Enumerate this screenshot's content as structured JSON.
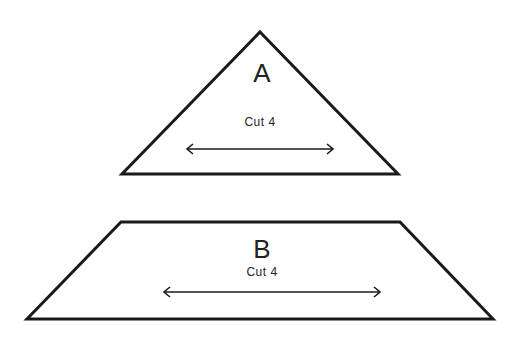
{
  "pieces": [
    {
      "id": "A",
      "shape": "triangle",
      "label": "A",
      "instruction": "Cut 4",
      "grain": "horizontal-double-arrow"
    },
    {
      "id": "B",
      "shape": "trapezoid",
      "label": "B",
      "instruction": "Cut 4",
      "grain": "horizontal-double-arrow"
    }
  ],
  "colors": {
    "stroke": "#1a1a1a",
    "background": "#ffffff"
  }
}
